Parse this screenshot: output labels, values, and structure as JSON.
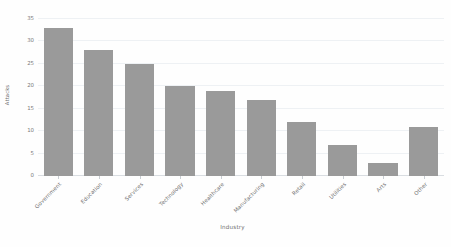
{
  "chart_data": {
    "type": "bar",
    "title": "",
    "subtitle": "",
    "xlabel": "Industry",
    "ylabel": "Attacks",
    "categories": [
      "Government",
      "Education",
      "Services",
      "Technology",
      "Healthcare",
      "Manufacturing",
      "Retail",
      "Utilities",
      "Arts",
      "Other"
    ],
    "values": [
      33,
      28,
      25,
      20,
      19,
      17,
      12,
      7,
      3,
      11
    ],
    "ylim": [
      0,
      35
    ],
    "yticks": [
      0,
      5,
      10,
      15,
      20,
      25,
      30,
      35
    ],
    "ytick_labels": [
      "0",
      "5",
      "10",
      "15",
      "20",
      "25",
      "30",
      "35"
    ],
    "grid": true,
    "legend": false,
    "legend_position": "none",
    "bar_color": "#9a9a9a",
    "background_color": "#fefefe",
    "gridline_color": "#eef1f4",
    "axis_text_color": "#6e6e6e",
    "xtick_label_rotation": -45
  }
}
